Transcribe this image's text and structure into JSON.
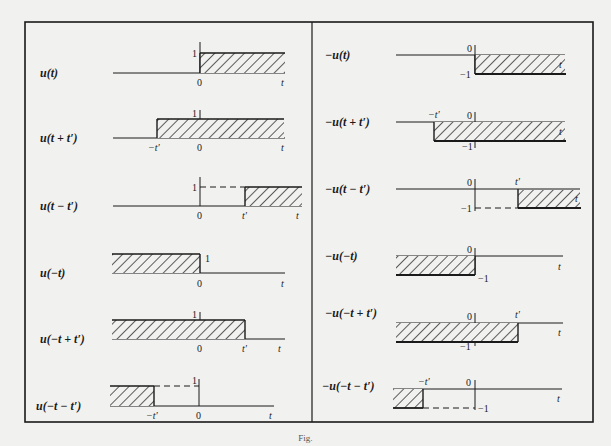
{
  "figure": {
    "caption": "Fig.",
    "left_panel": [
      {
        "label": "u(t)",
        "ticks": {
          "one": "1",
          "zero": "0",
          "t": "t"
        }
      },
      {
        "label": "u(t + t′)",
        "ticks": {
          "one": "1",
          "zero": "0",
          "neg_tp": "−t′",
          "t": "t"
        }
      },
      {
        "label": "u(t − t′)",
        "ticks": {
          "one": "1",
          "zero": "0",
          "tp": "t′",
          "t": "t"
        }
      },
      {
        "label": "u(−t)",
        "ticks": {
          "one": "1",
          "zero": "0",
          "t": "t"
        }
      },
      {
        "label": "u(−t + t′)",
        "ticks": {
          "one": "1",
          "zero": "0",
          "tp": "t′",
          "t": "t"
        }
      },
      {
        "label": "u(−t − t′)",
        "ticks": {
          "one": "1",
          "zero": "0",
          "neg_tp": "−t′",
          "t": "t"
        }
      }
    ],
    "right_panel": [
      {
        "label": "−u(t)",
        "ticks": {
          "zero": "0",
          "neg_one": "−1",
          "t": "t"
        }
      },
      {
        "label": "−u(t + t′)",
        "ticks": {
          "zero": "0",
          "neg_one": "−1",
          "neg_tp": "−t′",
          "t": "t"
        }
      },
      {
        "label": "−u(t − t′)",
        "ticks": {
          "zero": "0",
          "neg_one": "−1",
          "tp": "t′",
          "t": "t"
        }
      },
      {
        "label": "−u(−t)",
        "ticks": {
          "zero": "0",
          "neg_one": "−1",
          "t": "t"
        }
      },
      {
        "label": "−u(−t + t′)",
        "ticks": {
          "zero": "0",
          "neg_one": "−1",
          "tp": "t′",
          "t": "t"
        }
      },
      {
        "label": "−u(−t − t′)",
        "ticks": {
          "zero": "0",
          "neg_one": "−1",
          "neg_tp": "−t′",
          "t": "t"
        }
      }
    ]
  }
}
